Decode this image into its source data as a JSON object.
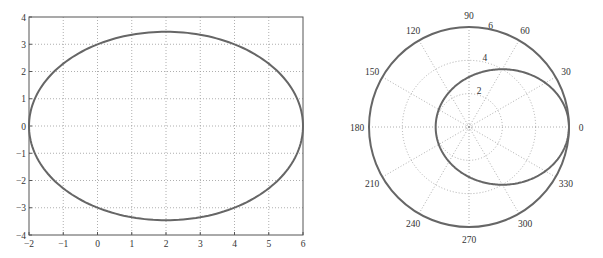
{
  "chart_data": [
    {
      "type": "line",
      "title": "",
      "xlabel": "",
      "ylabel": "",
      "xlim": [
        -2,
        6
      ],
      "ylim": [
        -4,
        4
      ],
      "grid": true,
      "x_ticks": [
        -2,
        -1,
        0,
        1,
        2,
        3,
        4,
        5,
        6
      ],
      "y_ticks": [
        -4,
        -3,
        -2,
        -1,
        0,
        1,
        2,
        3,
        4
      ],
      "x_tick_labels": [
        "−2",
        "−1",
        "0",
        "1",
        "2",
        "3",
        "4",
        "5",
        "6"
      ],
      "y_tick_labels": [
        "−4",
        "−3",
        "−2",
        "−1",
        "0",
        "1",
        "2",
        "3",
        "4"
      ],
      "series": [
        {
          "name": "ellipse",
          "description": "Ellipse centered at (2, 0), semi-axes 4 (x) and 3.46 (y)",
          "center": [
            2,
            0
          ],
          "semi_axis_x": 4,
          "semi_axis_y": 3.46,
          "x": [
            6,
            5.46,
            4,
            2,
            0,
            -1.46,
            -2,
            -1.46,
            0,
            2,
            4,
            5.46,
            6
          ],
          "y": [
            0,
            1.73,
            3.0,
            3.46,
            3.0,
            1.73,
            0,
            -1.73,
            -3.0,
            -3.46,
            -3.0,
            -1.73,
            0
          ]
        }
      ],
      "color": "#666666"
    },
    {
      "type": "line",
      "subtype": "polar",
      "title": "",
      "rlim": [
        0,
        6
      ],
      "r_ticks": [
        2,
        4,
        6
      ],
      "r_tick_labels": [
        "2",
        "4",
        "6"
      ],
      "theta_ticks_deg": [
        0,
        30,
        60,
        90,
        120,
        150,
        180,
        210,
        240,
        270,
        300,
        330
      ],
      "theta_tick_labels": [
        "0",
        "30",
        "60",
        "90",
        "120",
        "150",
        "180",
        "210",
        "240",
        "270",
        "300",
        "330"
      ],
      "grid": true,
      "series": [
        {
          "name": "outer circle",
          "description": "r = 6 (constant)",
          "theta_deg": [
            0,
            90,
            180,
            270,
            360
          ],
          "r": [
            6,
            6,
            6,
            6,
            6
          ]
        },
        {
          "name": "conic",
          "description": "r = 3 / (1 - 0.5 cos(theta)), ellipse with focus at origin",
          "theta_deg": [
            0,
            30,
            60,
            90,
            120,
            150,
            180,
            210,
            240,
            270,
            300,
            330
          ],
          "r": [
            6,
            5.35,
            4.0,
            3.0,
            2.4,
            2.09,
            2.0,
            2.09,
            2.4,
            3.0,
            4.0,
            5.35
          ]
        }
      ],
      "color": "#666666"
    }
  ]
}
